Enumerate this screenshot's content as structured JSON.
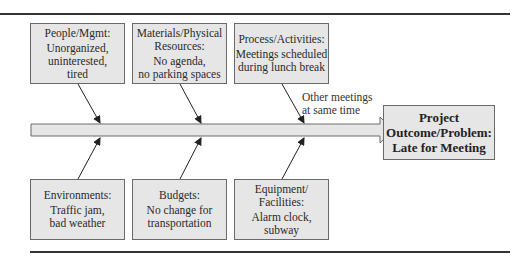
{
  "diagram": {
    "type": "fishbone",
    "outcome": {
      "lines": [
        "Project",
        "Outcome/Problem:",
        "Late for Meeting"
      ]
    },
    "causes_top": [
      {
        "category": "People/Mgmt:",
        "lines": [
          "Unorganized,",
          "uninterested,",
          "tired"
        ]
      },
      {
        "category": "Materials/Physical",
        "category2": "Resources:",
        "lines": [
          "No agenda,",
          "no parking spaces"
        ]
      },
      {
        "category": "Process/Activities:",
        "lines": [
          "Meetings scheduled",
          "during lunch break"
        ]
      }
    ],
    "causes_bottom": [
      {
        "category": "Environments:",
        "lines": [
          "Traffic jam,",
          "bad weather"
        ]
      },
      {
        "category": "Budgets:",
        "lines": [
          "No change for",
          "transportation"
        ]
      },
      {
        "category": "Equipment/",
        "category2": "Facilities:",
        "lines": [
          "Alarm clock,",
          "subway"
        ]
      }
    ],
    "spine_note": [
      "Other meetings",
      "at same time"
    ],
    "colors": {
      "box_fill": "#e6e6e6",
      "box_border": "#6a6a6a",
      "line": "#333333"
    }
  }
}
